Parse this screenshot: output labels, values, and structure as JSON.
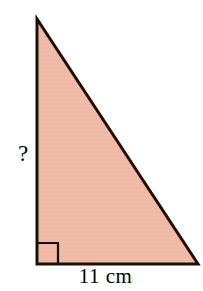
{
  "figure": {
    "type": "right-triangle-diagram",
    "background_color": "#FFFFFF",
    "fill_color": "#F0BCA9",
    "stroke_color": "#1A1008",
    "stroke_width": 3,
    "vertices": {
      "apex": [
        37,
        19
      ],
      "bottom_left": [
        37,
        264
      ],
      "bottom_right": [
        198,
        264
      ]
    },
    "right_angle_marker": {
      "name": "right-angle-square",
      "corner": [
        37,
        264
      ],
      "size": 21
    },
    "labels": {
      "vertical_side": "?",
      "base_side": "11 cm"
    },
    "known_measurements": [
      {
        "side": "base",
        "value": 11,
        "unit": "cm",
        "text": "11 cm"
      }
    ],
    "unknown_measurements": [
      {
        "side": "vertical",
        "text": "?"
      }
    ]
  }
}
